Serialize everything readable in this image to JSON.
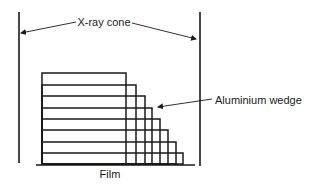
{
  "diagram": {
    "labels": {
      "cone": "X-ray cone",
      "wedge": "Aluminium wedge",
      "film": "Film"
    },
    "colors": {
      "stroke": "#1a1a1a",
      "background": "#ffffff"
    },
    "wedge_steps": [
      {
        "top": 73,
        "right": 126
      },
      {
        "top": 85,
        "right": 136
      },
      {
        "top": 96,
        "right": 145
      },
      {
        "top": 108,
        "right": 152
      },
      {
        "top": 119,
        "right": 160
      },
      {
        "top": 130,
        "right": 168
      },
      {
        "top": 142,
        "right": 176
      },
      {
        "top": 153,
        "right": 183
      }
    ]
  }
}
